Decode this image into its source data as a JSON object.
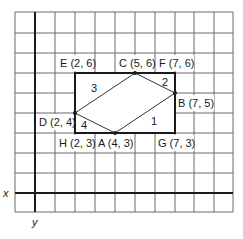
{
  "diagram": {
    "grid": {
      "left": 15,
      "top": 12,
      "cols": 11,
      "rows": 10,
      "cell": 19.8,
      "line_color": "#555555"
    },
    "axes": {
      "x_label": "x",
      "y_label": "y",
      "origin_px": [
        35,
        193
      ],
      "unit_px": 20,
      "color": "#1a1a1a"
    },
    "rectangle": {
      "vertices": [
        "E",
        "F",
        "G",
        "H"
      ],
      "color": "#1a1a1a"
    },
    "rhombus": {
      "vertices": [
        "A",
        "B",
        "C",
        "D"
      ],
      "color": "#333333"
    },
    "points": [
      {
        "name": "E",
        "coords": "(2, 6)",
        "label": "E (2, 6)",
        "x": 2,
        "y": 6
      },
      {
        "name": "C",
        "coords": "(5, 6)",
        "label": "C (5, 6)",
        "x": 5,
        "y": 6
      },
      {
        "name": "F",
        "coords": "(7, 6)",
        "label": "F (7, 6)",
        "x": 7,
        "y": 6
      },
      {
        "name": "B",
        "coords": "(7, 5)",
        "label": "B (7, 5)",
        "x": 7,
        "y": 5
      },
      {
        "name": "D",
        "coords": "(2, 4)",
        "label": "D (2, 4)",
        "x": 2,
        "y": 4
      },
      {
        "name": "H",
        "coords": "(2, 3)",
        "label": "H (2, 3)",
        "x": 2,
        "y": 3
      },
      {
        "name": "A",
        "coords": "(4, 3)",
        "label": "A (4, 3)",
        "x": 4,
        "y": 3
      },
      {
        "name": "G",
        "coords": "(7, 3)",
        "label": "G (7, 3)",
        "x": 7,
        "y": 3
      }
    ],
    "regions": [
      {
        "label": "1"
      },
      {
        "label": "2"
      },
      {
        "label": "3"
      },
      {
        "label": "4"
      }
    ]
  }
}
